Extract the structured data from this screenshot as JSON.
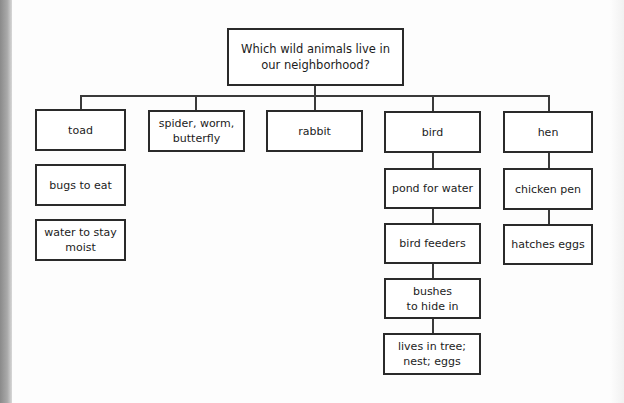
{
  "diagram": {
    "type": "tree",
    "root": {
      "label": "Which wild animals live in our neighborhood?"
    },
    "branches": [
      {
        "label": "toad",
        "children_connected": false,
        "children": [
          "bugs to eat",
          "water to stay moist"
        ]
      },
      {
        "label": "spider, worm, butterfly",
        "children_connected": false,
        "children": []
      },
      {
        "label": "rabbit",
        "children_connected": false,
        "children": []
      },
      {
        "label": "bird",
        "children_connected": true,
        "children": [
          "pond for water",
          "bird feeders",
          "bushes to hide in",
          "lives in tree; nest; eggs"
        ]
      },
      {
        "label": "hen",
        "children_connected": true,
        "children": [
          "chicken pen",
          "hatches eggs"
        ]
      }
    ]
  },
  "colors": {
    "border": "#2a2a2a",
    "line": "#3a3a3a",
    "background": "#fdfdfd",
    "edge_strip": "#9a9a9a"
  }
}
